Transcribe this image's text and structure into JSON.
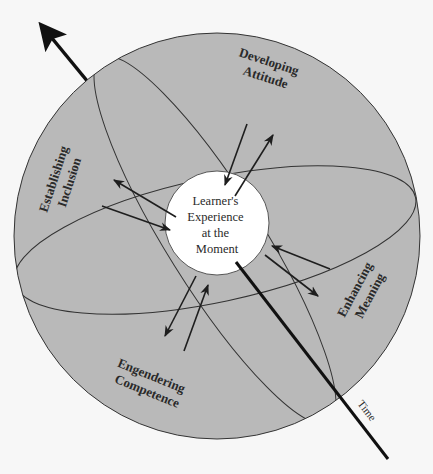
{
  "diagram": {
    "center": {
      "lines": [
        "Learner's",
        "Experience",
        "at the",
        "Moment"
      ]
    },
    "conditions": [
      {
        "id": "developing-attitude",
        "lines": [
          "Developing",
          "Attitude"
        ]
      },
      {
        "id": "establishing-inclusion",
        "lines": [
          "Establishing",
          "Inclusion"
        ]
      },
      {
        "id": "enhancing-meaning",
        "lines": [
          "Enhancing",
          "Meaning"
        ]
      },
      {
        "id": "engendering-competence",
        "lines": [
          "Engendering",
          "Competence"
        ]
      }
    ],
    "axis": {
      "label": "Time"
    },
    "colors": {
      "outer_fill": "#b9b9b9",
      "inner_fill": "#ffffff",
      "stroke": "#1e1e1e",
      "background": "#f7f7f7"
    }
  }
}
